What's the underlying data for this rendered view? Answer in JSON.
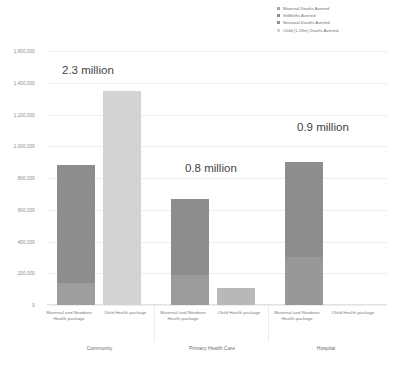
{
  "chart_data": {
    "type": "bar",
    "title": "",
    "subtitle": "",
    "xlabel": "",
    "ylabel": "",
    "stacked": true,
    "grid": true,
    "legend_position": "top-right",
    "ylim": [
      0,
      1600000
    ],
    "yticks": [
      0,
      200000,
      400000,
      600000,
      800000,
      1000000,
      1200000,
      1400000,
      1600000
    ],
    "ytick_labels": [
      "0",
      "200,000",
      "400,000",
      "600,000",
      "800,000",
      "1,000,000",
      "1,200,000",
      "1,400,000",
      "1,600,000"
    ],
    "groups": [
      "Community",
      "Primary Health Care",
      "Hospital"
    ],
    "categories": [
      "Maternal and Newborn Health package",
      "Child Health package"
    ],
    "series": [
      {
        "name": "Maternal Deaths Averted",
        "color": "#a6a6a6"
      },
      {
        "name": "Stillbirths Averted",
        "color": "#8c8c8c"
      },
      {
        "name": "Neonatal Deaths Averted",
        "color": "#919191"
      },
      {
        "name": "Child (1-59m) Deaths Averted",
        "color": "#d3d3d3"
      }
    ],
    "bars": [
      {
        "group": "Community",
        "category": "Maternal and Newborn Health package",
        "total": 880000,
        "segments": [
          {
            "series": "Maternal Deaths Averted",
            "value": 140000,
            "color": "#9e9e9e"
          },
          {
            "series": "Stillbirths Averted",
            "value": 740000,
            "color": "#8d8d8d"
          }
        ]
      },
      {
        "group": "Community",
        "category": "Child Health package",
        "total": 1350000,
        "segments": [
          {
            "series": "Child (1-59m) Deaths Averted",
            "value": 1350000,
            "color": "#d3d3d3"
          }
        ]
      },
      {
        "group": "Primary Health Care",
        "category": "Maternal and Newborn Health package",
        "total": 665000,
        "segments": [
          {
            "series": "Maternal Deaths Averted",
            "value": 190000,
            "color": "#9b9b9b"
          },
          {
            "series": "Stillbirths Averted",
            "value": 475000,
            "color": "#8d8d8d"
          }
        ]
      },
      {
        "group": "Primary Health Care",
        "category": "Child Health package",
        "total": 110000,
        "segments": [
          {
            "series": "Child (1-59m) Deaths Averted",
            "value": 110000,
            "color": "#b8b8b8"
          }
        ]
      },
      {
        "group": "Hospital",
        "category": "Maternal and Newborn Health package",
        "total": 900000,
        "segments": [
          {
            "series": "Maternal Deaths Averted",
            "value": 300000,
            "color": "#989898"
          },
          {
            "series": "Stillbirths Averted",
            "value": 600000,
            "color": "#8d8d8d"
          }
        ]
      },
      {
        "group": "Hospital",
        "category": "Child Health package",
        "total": 0,
        "segments": []
      }
    ],
    "annotations": [
      {
        "text": "2.3 million",
        "group": "Community"
      },
      {
        "text": "0.8 million",
        "group": "Primary Health Care"
      },
      {
        "text": "0.9 million",
        "group": "Hospital"
      }
    ]
  },
  "legend": {
    "items": [
      {
        "label": "Maternal Deaths Averted",
        "color": "#a6a6a6"
      },
      {
        "label": "Stillbirths Averted",
        "color": "#8c8c8c"
      },
      {
        "label": "Neonatal Deaths Averted",
        "color": "#919191"
      },
      {
        "label": "Child (1-59m) Deaths Averted",
        "color": "#d3d3d3"
      }
    ]
  },
  "axis": {
    "ytick_labels": [
      "1,600,000",
      "1,400,000",
      "1,200,000",
      "1,000,000",
      "800,000",
      "600,000",
      "400,000",
      "200,000",
      "0"
    ]
  },
  "xaxis": {
    "cat_labels": [
      "Maternal and Newborn Health package",
      "Child Health package",
      "Maternal and Newborn Health package",
      "Child Health package",
      "Maternal and Newborn Health package",
      "Child Health package"
    ],
    "group_labels": [
      "Community",
      "Primary Health Care",
      "Hospital"
    ]
  },
  "annotations": {
    "community": "2.3 million",
    "phc": "0.8 million",
    "hospital": "0.9 million"
  }
}
